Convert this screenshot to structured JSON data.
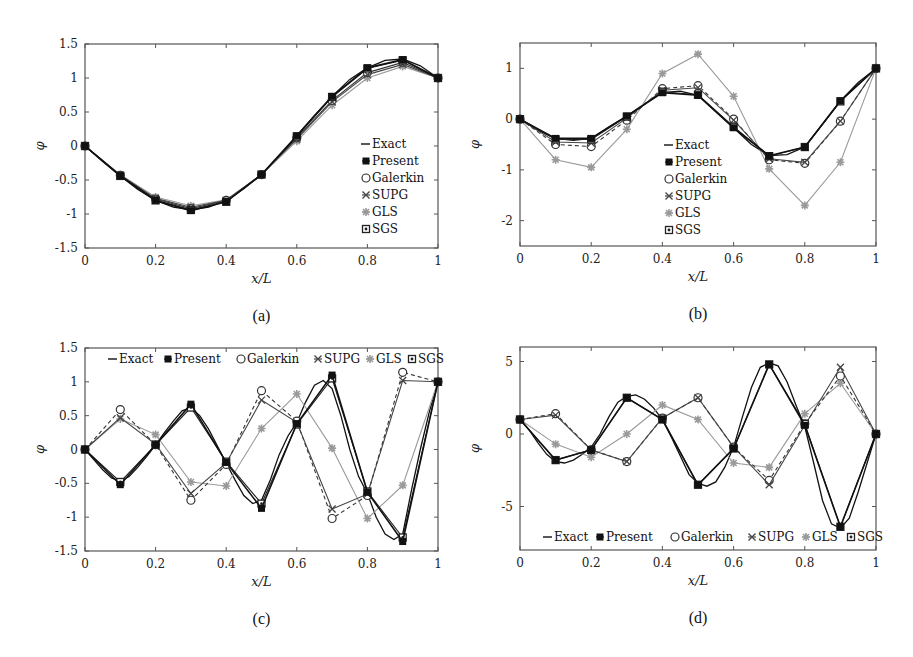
{
  "figure": {
    "width": 913,
    "height": 657,
    "colors": {
      "exact": "#111111",
      "present": "#111111",
      "galerkin": "#333333",
      "supg": "#444444",
      "gls": "#9a9a9a",
      "sgs": "#222222",
      "axis": "#555555"
    }
  },
  "chart_data": [
    {
      "id": "a",
      "type": "line",
      "caption": "(a)",
      "xlabel": "x/L",
      "ylabel": "φ",
      "xlim": [
        0,
        1
      ],
      "ylim": [
        -1.5,
        1.5
      ],
      "xticks": [
        0,
        0.2,
        0.4,
        0.6,
        0.8,
        1
      ],
      "xtick_labels": [
        "0",
        "0.2",
        "0.4",
        "0.6",
        "0.8",
        "1"
      ],
      "yticks": [
        -1.5,
        -1,
        -0.5,
        0,
        0.5,
        1,
        1.5
      ],
      "ytick_labels": [
        "-1.5",
        "-1",
        "-0.5",
        "0",
        "0.5",
        "1",
        "1.5"
      ],
      "grid": false,
      "legend": {
        "position": "right-inside-vertical",
        "entries": [
          "Exact",
          "Present",
          "Galerkin",
          "SUPG",
          "GLS",
          "SGS"
        ]
      },
      "box": {
        "x": 85,
        "y": 44,
        "w": 353,
        "h": 204
      },
      "legend_box": {
        "x": 366,
        "y": 144,
        "dy": 17,
        "orientation": "vertical"
      },
      "x": [
        0,
        0.1,
        0.2,
        0.3,
        0.4,
        0.5,
        0.6,
        0.7,
        0.8,
        0.9,
        1.0
      ],
      "exact": {
        "x": [
          0,
          0.05,
          0.1,
          0.15,
          0.2,
          0.25,
          0.3,
          0.35,
          0.4,
          0.45,
          0.5,
          0.55,
          0.6,
          0.65,
          0.7,
          0.75,
          0.8,
          0.85,
          0.9,
          0.95,
          1.0
        ],
        "y": [
          0,
          -0.23,
          -0.44,
          -0.64,
          -0.8,
          -0.9,
          -0.94,
          -0.9,
          -0.8,
          -0.63,
          -0.42,
          -0.15,
          0.15,
          0.45,
          0.73,
          0.98,
          1.15,
          1.26,
          1.28,
          1.18,
          1.0
        ]
      },
      "series": [
        {
          "name": "Present",
          "marker": "filled-square",
          "style": "solid",
          "values": [
            0,
            -0.44,
            -0.8,
            -0.95,
            -0.82,
            -0.42,
            0.15,
            0.73,
            1.15,
            1.27,
            1.0
          ]
        },
        {
          "name": "Galerkin",
          "marker": "open-circle",
          "style": "solid",
          "values": [
            0,
            -0.43,
            -0.78,
            -0.92,
            -0.8,
            -0.42,
            0.12,
            0.67,
            1.08,
            1.23,
            1.0
          ]
        },
        {
          "name": "SUPG",
          "marker": "cross",
          "style": "solid",
          "values": [
            0,
            -0.43,
            -0.77,
            -0.9,
            -0.8,
            -0.42,
            0.1,
            0.65,
            1.05,
            1.2,
            1.0
          ]
        },
        {
          "name": "GLS",
          "marker": "star",
          "style": "solid",
          "values": [
            0,
            -0.42,
            -0.75,
            -0.88,
            -0.79,
            -0.42,
            0.07,
            0.6,
            1.0,
            1.17,
            1.0
          ]
        },
        {
          "name": "SGS",
          "marker": "boxed-dot",
          "style": "solid",
          "values": [
            0,
            -0.44,
            -0.8,
            -0.94,
            -0.82,
            -0.42,
            0.14,
            0.72,
            1.14,
            1.26,
            1.0
          ]
        }
      ]
    },
    {
      "id": "b",
      "type": "line",
      "caption": "(b)",
      "xlabel": "x/L",
      "ylabel": "φ",
      "xlim": [
        0,
        1
      ],
      "ylim": [
        -2.5,
        1.5
      ],
      "xticks": [
        0,
        0.2,
        0.4,
        0.6,
        0.8,
        1
      ],
      "xtick_labels": [
        "0",
        "0.2",
        "0.4",
        "0.6",
        "0.8",
        "1"
      ],
      "yticks": [
        -2,
        -1,
        0,
        1
      ],
      "ytick_labels": [
        "-2",
        "-1",
        "0",
        "1"
      ],
      "grid": false,
      "legend": {
        "position": "center-inside-vertical",
        "entries": [
          "Exact",
          "Present",
          "Galerkin",
          "SUPG",
          "GLS",
          "SGS"
        ]
      },
      "box": {
        "x": 520,
        "y": 43,
        "w": 356,
        "h": 203
      },
      "legend_box": {
        "x": 669,
        "y": 145,
        "dy": 17,
        "orientation": "vertical"
      },
      "x": [
        0,
        0.1,
        0.2,
        0.3,
        0.4,
        0.5,
        0.6,
        0.7,
        0.8,
        0.9,
        1.0
      ],
      "exact": {
        "x": [
          0,
          0.05,
          0.1,
          0.15,
          0.2,
          0.25,
          0.3,
          0.35,
          0.4,
          0.45,
          0.5,
          0.55,
          0.6,
          0.65,
          0.7,
          0.75,
          0.8,
          0.85,
          0.9,
          0.95,
          1.0
        ],
        "y": [
          0,
          -0.22,
          -0.38,
          -0.42,
          -0.38,
          -0.15,
          0.06,
          0.3,
          0.52,
          0.55,
          0.47,
          0.15,
          -0.17,
          -0.5,
          -0.72,
          -0.7,
          -0.55,
          -0.1,
          0.36,
          0.72,
          1.0
        ]
      },
      "series": [
        {
          "name": "Present",
          "marker": "filled-square",
          "style": "solid",
          "values": [
            0,
            -0.38,
            -0.38,
            0.06,
            0.52,
            0.47,
            -0.17,
            -0.72,
            -0.55,
            0.36,
            1.0
          ]
        },
        {
          "name": "Galerkin",
          "marker": "open-circle",
          "style": "dashed",
          "values": [
            0,
            -0.5,
            -0.54,
            -0.02,
            0.6,
            0.66,
            0.0,
            -0.8,
            -0.87,
            -0.04,
            1.0
          ]
        },
        {
          "name": "SUPG",
          "marker": "cross",
          "style": "solid",
          "values": [
            0,
            -0.45,
            -0.47,
            0.02,
            0.57,
            0.62,
            -0.02,
            -0.78,
            -0.85,
            -0.04,
            1.0
          ]
        },
        {
          "name": "GLS",
          "marker": "star",
          "style": "solid",
          "values": [
            0,
            -0.8,
            -0.95,
            -0.2,
            0.9,
            1.28,
            0.45,
            -0.98,
            -1.7,
            -0.85,
            1.0
          ]
        },
        {
          "name": "SGS",
          "marker": "boxed-dot",
          "style": "solid",
          "values": [
            0,
            -0.4,
            -0.4,
            0.05,
            0.54,
            0.48,
            -0.15,
            -0.73,
            -0.55,
            0.35,
            1.0
          ]
        }
      ]
    },
    {
      "id": "c",
      "type": "line",
      "caption": "(c)",
      "xlabel": "x/L",
      "ylabel": "φ",
      "xlim": [
        0,
        1
      ],
      "ylim": [
        -1.5,
        1.5
      ],
      "xticks": [
        0,
        0.2,
        0.4,
        0.6,
        0.8,
        1
      ],
      "xtick_labels": [
        "0",
        "0.2",
        "0.4",
        "0.6",
        "0.8",
        "1"
      ],
      "yticks": [
        -1.5,
        -1,
        -0.5,
        0,
        0.5,
        1,
        1.5
      ],
      "ytick_labels": [
        "-1.5",
        "-1",
        "-0.5",
        "0",
        "0.5",
        "1",
        "1.5"
      ],
      "grid": false,
      "legend": {
        "position": "top-inside-horizontal",
        "entries": [
          "Exact",
          "Present",
          "Galerkin",
          "SUPG",
          "GLS",
          "SGS"
        ]
      },
      "box": {
        "x": 85,
        "y": 348,
        "w": 353,
        "h": 203
      },
      "legend_box": {
        "x": 113,
        "y": 359,
        "orientation": "horizontal",
        "offsets": [
          0,
          55,
          128,
          205,
          257,
          299
        ]
      },
      "x": [
        0,
        0.1,
        0.2,
        0.3,
        0.4,
        0.5,
        0.6,
        0.7,
        0.8,
        0.9,
        1.0
      ],
      "exact": {
        "x": [
          0,
          0.025,
          0.05,
          0.075,
          0.1,
          0.125,
          0.15,
          0.175,
          0.2,
          0.225,
          0.25,
          0.275,
          0.3,
          0.325,
          0.35,
          0.375,
          0.4,
          0.425,
          0.45,
          0.475,
          0.5,
          0.525,
          0.55,
          0.575,
          0.6,
          0.625,
          0.65,
          0.675,
          0.7,
          0.725,
          0.75,
          0.775,
          0.8,
          0.825,
          0.85,
          0.875,
          0.9,
          0.925,
          0.95,
          0.975,
          1.0
        ],
        "y": [
          0,
          -0.15,
          -0.3,
          -0.42,
          -0.47,
          -0.4,
          -0.26,
          -0.1,
          0.07,
          0.25,
          0.42,
          0.57,
          0.62,
          0.5,
          0.3,
          0.05,
          -0.2,
          -0.45,
          -0.68,
          -0.8,
          -0.75,
          -0.45,
          -0.08,
          0.2,
          0.4,
          0.7,
          0.95,
          1.02,
          0.9,
          0.5,
          0.0,
          -0.4,
          -0.65,
          -1.0,
          -1.25,
          -1.33,
          -1.25,
          -0.6,
          0.0,
          0.55,
          1.0
        ]
      },
      "series": [
        {
          "name": "Present",
          "marker": "filled-square",
          "style": "solid",
          "values": [
            0,
            -0.52,
            0.07,
            0.67,
            -0.19,
            -0.87,
            0.38,
            1.1,
            -0.63,
            -1.36,
            1.0
          ]
        },
        {
          "name": "Galerkin",
          "marker": "open-circle",
          "style": "dashed",
          "values": [
            0,
            0.59,
            0.07,
            -0.75,
            -0.22,
            0.87,
            0.42,
            -1.02,
            -0.68,
            1.14,
            1.0
          ]
        },
        {
          "name": "SUPG",
          "marker": "cross",
          "style": "solid",
          "values": [
            0,
            0.47,
            0.08,
            -0.65,
            -0.2,
            0.73,
            0.4,
            -0.88,
            -0.66,
            1.02,
            1.0
          ]
        },
        {
          "name": "GLS",
          "marker": "star",
          "style": "solid",
          "values": [
            0,
            0.45,
            0.22,
            -0.48,
            -0.54,
            0.31,
            0.82,
            0.02,
            -1.02,
            -0.53,
            1.0
          ]
        },
        {
          "name": "SGS",
          "marker": "boxed-dot",
          "style": "solid",
          "values": [
            0,
            -0.48,
            0.07,
            0.62,
            -0.18,
            -0.8,
            0.37,
            1.05,
            -0.62,
            -1.3,
            1.0
          ]
        }
      ]
    },
    {
      "id": "d",
      "type": "line",
      "caption": "(d)",
      "xlabel": "x/L",
      "ylabel": "φ",
      "xlim": [
        0,
        1
      ],
      "ylim": [
        -8,
        6
      ],
      "xticks": [
        0,
        0.2,
        0.4,
        0.6,
        0.8,
        1
      ],
      "xtick_labels": [
        "0",
        "0.2",
        "0.4",
        "0.6",
        "0.8",
        "1"
      ],
      "yticks": [
        -5,
        0,
        5
      ],
      "ytick_labels": [
        "-5",
        "0",
        "5"
      ],
      "grid": false,
      "legend": {
        "position": "bottom-inside-horizontal",
        "entries": [
          "Exact",
          "Present",
          "Galerkin",
          "SUPG",
          "GLS",
          "SGS"
        ]
      },
      "box": {
        "x": 520,
        "y": 347,
        "w": 356,
        "h": 203
      },
      "legend_box": {
        "x": 548,
        "y": 537,
        "orientation": "horizontal",
        "offsets": [
          0,
          52,
          127,
          204,
          258,
          303
        ]
      },
      "x": [
        0,
        0.1,
        0.2,
        0.3,
        0.4,
        0.5,
        0.6,
        0.7,
        0.8,
        0.9,
        1.0
      ],
      "exact": {
        "x": [
          0,
          0.025,
          0.05,
          0.075,
          0.1,
          0.125,
          0.15,
          0.175,
          0.2,
          0.225,
          0.25,
          0.275,
          0.3,
          0.325,
          0.35,
          0.375,
          0.4,
          0.425,
          0.45,
          0.475,
          0.5,
          0.525,
          0.55,
          0.575,
          0.6,
          0.625,
          0.65,
          0.675,
          0.7,
          0.725,
          0.75,
          0.775,
          0.8,
          0.825,
          0.85,
          0.875,
          0.9,
          0.925,
          0.95,
          0.975,
          1.0
        ],
        "y": [
          1.0,
          0.3,
          -0.6,
          -1.4,
          -1.9,
          -2.0,
          -1.8,
          -1.4,
          -0.9,
          0.0,
          1.2,
          2.2,
          2.6,
          2.7,
          2.4,
          1.8,
          1.0,
          -0.2,
          -1.5,
          -2.8,
          -3.4,
          -3.6,
          -3.3,
          -2.3,
          -0.9,
          1.2,
          3.2,
          4.6,
          4.9,
          4.7,
          3.6,
          2.0,
          0.5,
          -2.0,
          -4.6,
          -6.2,
          -6.5,
          -5.8,
          -4.0,
          -2.0,
          0.0
        ]
      },
      "series": [
        {
          "name": "Present",
          "marker": "filled-square",
          "style": "solid",
          "values": [
            1.0,
            -1.8,
            -1.1,
            2.5,
            1.0,
            -3.5,
            -1.0,
            4.8,
            0.6,
            -6.4,
            0.0
          ]
        },
        {
          "name": "Galerkin",
          "marker": "open-circle",
          "style": "dashed",
          "values": [
            1.0,
            1.4,
            -1.1,
            -1.9,
            1.1,
            2.5,
            -0.9,
            -3.2,
            0.7,
            4.0,
            0.0
          ]
        },
        {
          "name": "SUPG",
          "marker": "cross",
          "style": "solid",
          "values": [
            1.0,
            1.3,
            -1.1,
            -1.9,
            1.1,
            2.5,
            -0.9,
            -3.5,
            0.6,
            4.6,
            0.0
          ]
        },
        {
          "name": "GLS",
          "marker": "star",
          "style": "solid",
          "values": [
            1.0,
            -0.7,
            -1.6,
            0.0,
            2.0,
            1.0,
            -2.0,
            -2.3,
            1.4,
            3.5,
            0.0
          ]
        },
        {
          "name": "SGS",
          "marker": "boxed-dot",
          "style": "solid",
          "values": [
            1.0,
            -1.8,
            -1.1,
            2.5,
            1.0,
            -3.5,
            -1.0,
            4.8,
            0.7,
            -6.4,
            0.0
          ]
        }
      ]
    }
  ]
}
